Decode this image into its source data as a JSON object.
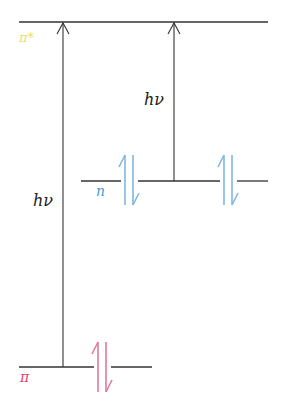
{
  "diagram": {
    "type": "molecular-orbital-energy-level",
    "levels": [
      {
        "id": "pi_star",
        "label": "π*",
        "color": "#e8e070",
        "y": 22,
        "x1": 19,
        "x2": 268
      },
      {
        "id": "n",
        "label": "n",
        "color": "#4a9bd6",
        "y": 181,
        "x1": 81,
        "x2": 268
      },
      {
        "id": "pi",
        "label": "π",
        "color": "#e0406e",
        "y": 367,
        "x1": 19,
        "x2": 152
      }
    ],
    "transitions": [
      {
        "id": "pi-to-pistar",
        "label": "hν",
        "from": "pi",
        "to": "pi_star",
        "x": 63
      },
      {
        "id": "n-to-pistar",
        "label": "hν",
        "from": "n",
        "to": "pi_star",
        "x": 174
      }
    ],
    "electron_pairs": [
      {
        "level": "n",
        "x": 129,
        "color": "#7fb6e0"
      },
      {
        "level": "n",
        "x": 228,
        "color": "#7fb6e0"
      },
      {
        "level": "pi",
        "x": 102,
        "color": "#e07a9a"
      }
    ],
    "line_color": "#333333"
  }
}
